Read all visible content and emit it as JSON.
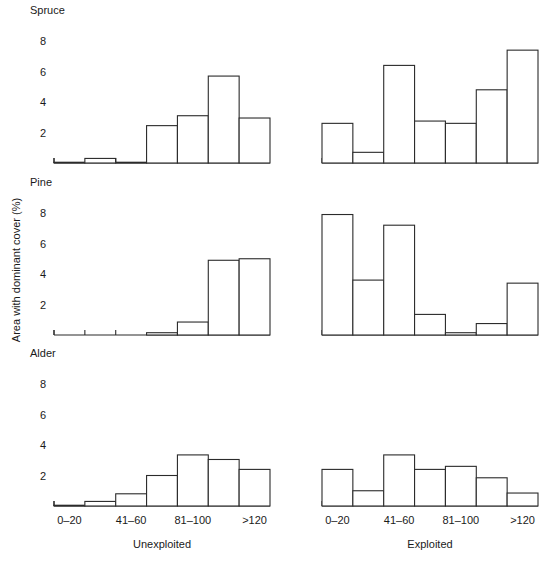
{
  "figure": {
    "ylabel": "Area with dominant cover (%)",
    "y_ticks": [
      "2",
      "4",
      "6",
      "8"
    ],
    "y_tick_values": [
      2,
      4,
      6,
      8
    ],
    "ylim": [
      0,
      8.6
    ],
    "x_tick_labels": [
      "0–20",
      "41–60",
      "81–100",
      ">120"
    ],
    "x_tick_bar_index": [
      0,
      2,
      4,
      6
    ],
    "columns": [
      {
        "key": "unexploited",
        "label": "Unexploited"
      },
      {
        "key": "exploited",
        "label": "Exploited"
      }
    ],
    "panels": [
      {
        "key": "spruce",
        "title": "Spruce"
      },
      {
        "key": "pine",
        "title": "Pine"
      },
      {
        "key": "alder",
        "title": "Alder"
      }
    ]
  },
  "chart_data": {
    "type": "bar",
    "title": "",
    "xlabel": "Stand age class (years)",
    "ylabel": "Area with dominant cover (%)",
    "ylim": [
      0,
      8.6
    ],
    "grid": false,
    "legend": "none",
    "categories": [
      "0–20",
      "21–40",
      "41–60",
      "61–80",
      "81–100",
      "101–120",
      ">120"
    ],
    "panels": [
      {
        "name": "Spruce",
        "series": [
          {
            "name": "Unexploited",
            "values": [
              0.05,
              0.3,
              0.05,
              2.45,
              3.1,
              5.7,
              2.95
            ]
          },
          {
            "name": "Exploited",
            "values": [
              2.6,
              0.7,
              6.4,
              2.75,
              2.6,
              4.8,
              7.4
            ]
          }
        ]
      },
      {
        "name": "Pine",
        "series": [
          {
            "name": "Unexploited",
            "values": [
              0.0,
              0.0,
              0.0,
              0.15,
              0.85,
              4.9,
              5.0
            ]
          },
          {
            "name": "Exploited",
            "values": [
              7.9,
              3.6,
              7.2,
              1.35,
              0.15,
              0.75,
              3.4
            ]
          }
        ]
      },
      {
        "name": "Alder",
        "series": [
          {
            "name": "Unexploited",
            "values": [
              0.05,
              0.3,
              0.8,
              2.0,
              3.35,
              3.05,
              2.4
            ]
          },
          {
            "name": "Exploited",
            "values": [
              2.4,
              1.0,
              3.35,
              2.4,
              2.6,
              1.85,
              0.85
            ]
          }
        ]
      }
    ]
  }
}
